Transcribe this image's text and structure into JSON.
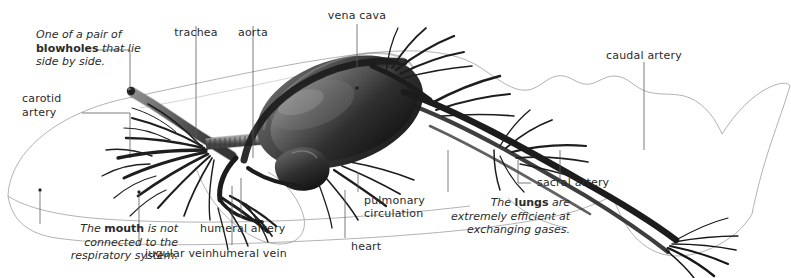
{
  "figure": {
    "ink_color": "#1a1a1a",
    "outline_color": "#9a9a9a",
    "leader_color": "#555555",
    "text_color": "#2b2b2b"
  },
  "labels": {
    "trachea": "trachea",
    "aorta": "aorta",
    "vena_cava": "vena cava",
    "caudal_artery": "caudal artery",
    "sacral_artery": "sacral artery",
    "carotid_artery_l1": "carotid",
    "carotid_artery_l2": "artery",
    "pulmonary_circulation_l1": "pulmonary",
    "pulmonary_circulation_l2": "circulation",
    "heart": "heart",
    "humeral_artery": "humeral artery",
    "humeral_vein": "humeral vein",
    "jugular_vein": "jugular vein"
  },
  "notes": {
    "blowholes": {
      "line1_pre": "One of a pair of",
      "line2_bold": "blowholes",
      "line2_post": " that lie",
      "line3": "side by side."
    },
    "mouth": {
      "line1_pre": "The ",
      "line1_bold": "mouth",
      "line1_post": " is not",
      "line2": "connected to the",
      "line3": "respiratory system."
    },
    "lungs": {
      "line1_pre": "The ",
      "line1_bold": "lungs",
      "line1_post": " are",
      "line2": "extremely efficient at",
      "line3": "exchanging gases."
    }
  }
}
